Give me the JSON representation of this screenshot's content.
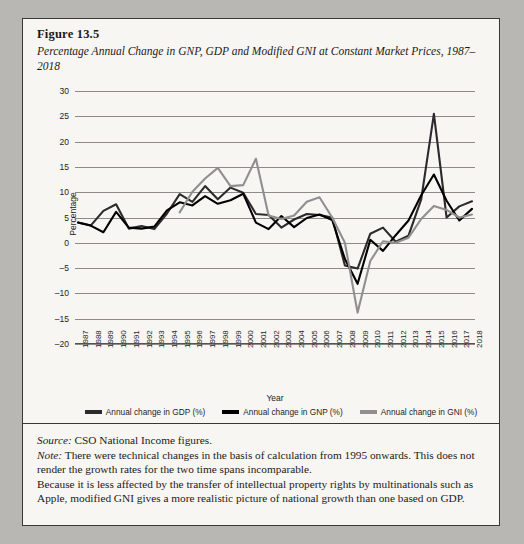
{
  "figure": {
    "number": "Figure 13.5",
    "title": "Percentage Annual Change in GNP, GDP and Modified GNI at Constant Market Prices, 1987–2018"
  },
  "notes": {
    "source_label": "Source:",
    "source_text": " CSO National Income figures.",
    "note_label": "Note:",
    "note_text": " There were technical changes in the basis of calculation from 1995 onwards. This does not render the growth rates for the two time spans incomparable.",
    "extra_text": "Because it is less affected by the transfer of intellectual property rights by multinationals such as Apple, modified GNI gives a more realistic picture of national growth than one based on GDP."
  },
  "colors": {
    "gdp": "#2b2b2b",
    "gnp": "#000000",
    "gni": "#8f8f8f",
    "grid": "#8d8a87",
    "axis": "#55524f",
    "panel_bg": "#f7f6f3",
    "page_bg": "#b9b7b4",
    "border": "#3a3835",
    "text": "#1c1a18"
  },
  "chart_data": {
    "type": "line",
    "title": "Percentage Annual Change in GNP, GDP and Modified GNI at Constant Market Prices, 1987–2018",
    "xlabel": "Year",
    "ylabel": "Percentage",
    "ylim": [
      -20,
      30
    ],
    "ytick_step": 5,
    "yticks": [
      30,
      25,
      20,
      15,
      10,
      5,
      0,
      -5,
      -10,
      -15,
      -20
    ],
    "grid": true,
    "legend_position": "bottom",
    "categories": [
      "1987",
      "1988",
      "1989",
      "1990",
      "1991",
      "1992",
      "1993",
      "1994",
      "1995",
      "1996",
      "1997",
      "1998",
      "1999",
      "2000",
      "2001",
      "2002",
      "2003",
      "2004",
      "2005",
      "2006",
      "2007",
      "2008",
      "2009",
      "2010",
      "2011",
      "2012",
      "2013",
      "2014",
      "2015",
      "2016",
      "2017",
      "2018"
    ],
    "series": [
      {
        "name": "Annual change in GDP (%)",
        "color": "#2b2b2b",
        "values": [
          4.0,
          3.4,
          6.3,
          7.6,
          2.8,
          3.3,
          2.7,
          5.8,
          9.6,
          8.1,
          11.2,
          8.6,
          10.9,
          9.9,
          5.7,
          5.5,
          3.0,
          4.6,
          5.7,
          5.5,
          5.0,
          -4.5,
          -5.1,
          1.8,
          3.0,
          0.2,
          1.4,
          8.6,
          25.5,
          5.0,
          7.2,
          8.2
        ]
      },
      {
        "name": "Annual change in GNP (%)",
        "color": "#000000",
        "values": [
          4.0,
          3.4,
          2.1,
          6.1,
          3.0,
          2.8,
          3.2,
          6.4,
          8.0,
          7.4,
          9.2,
          7.7,
          8.4,
          9.7,
          4.0,
          2.7,
          5.3,
          3.1,
          4.9,
          5.6,
          4.5,
          -3.2,
          -8.1,
          0.6,
          -1.6,
          1.5,
          4.4,
          9.4,
          13.5,
          8.3,
          4.4,
          6.7
        ]
      },
      {
        "name": "Annual change in GNI (%)",
        "color": "#8f8f8f",
        "values": [
          null,
          null,
          null,
          null,
          null,
          null,
          null,
          null,
          6.0,
          10.1,
          12.7,
          14.8,
          11.2,
          11.4,
          16.6,
          5.4,
          4.7,
          5.4,
          8.1,
          9.0,
          5.0,
          0.0,
          -13.8,
          -3.6,
          0.3,
          0.0,
          1.0,
          4.7,
          7.3,
          6.5,
          5.0,
          5.6
        ]
      }
    ]
  }
}
